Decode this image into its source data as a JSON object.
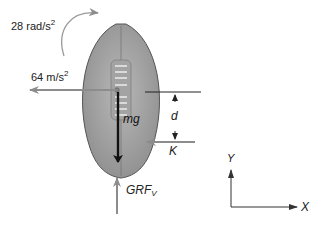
{
  "diagram": {
    "labels": {
      "angular_accel_value": "28 rad/s",
      "angular_accel_exp": "2",
      "linear_accel_value": "64 m/s",
      "linear_accel_exp": "2",
      "weight": "mg",
      "moment_arm": "d",
      "kick_force": "K",
      "grf_main": "GRF",
      "grf_sub": "V",
      "axis_x": "X",
      "axis_y": "Y"
    },
    "colors": {
      "ball_fill": "#a9a9a9",
      "ball_stroke": "#555555",
      "arrow_gray": "#8c8c8c",
      "arrow_black": "#111111",
      "lace_white": "#f2f2f2",
      "text": "#222222"
    },
    "forces": [
      {
        "name": "angular acceleration",
        "label": "28 rad/s²",
        "direction": "clockwise"
      },
      {
        "name": "linear acceleration",
        "label": "64 m/s²",
        "direction": "left"
      },
      {
        "name": "weight",
        "label": "mg",
        "direction": "down"
      },
      {
        "name": "kick force",
        "label": "K",
        "direction": "left"
      },
      {
        "name": "vertical ground reaction force",
        "label": "GRF_V",
        "direction": "up"
      },
      {
        "name": "moment arm",
        "label": "d",
        "direction": "vertical distance"
      }
    ]
  }
}
